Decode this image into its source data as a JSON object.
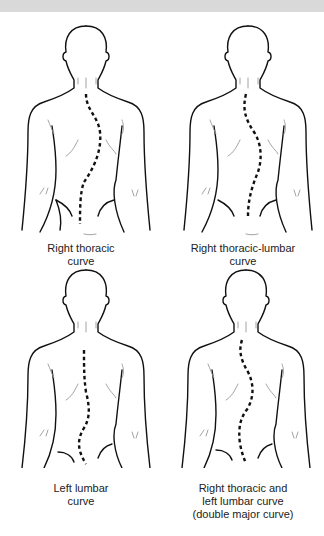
{
  "figure": {
    "panels": [
      {
        "id": "right-thoracic",
        "caption_lines": [
          "Right thoracic",
          "curve"
        ]
      },
      {
        "id": "right-thoracic-lumbar",
        "caption_lines": [
          "Right thoracic-lumbar",
          "curve"
        ]
      },
      {
        "id": "left-lumbar",
        "caption_lines": [
          "Left lumbar",
          "curve"
        ]
      },
      {
        "id": "double-major",
        "caption_lines": [
          "Right thoracic and",
          "left lumbar curve",
          "(double major curve)"
        ]
      }
    ]
  },
  "colors": {
    "header_bar": "#d9d9d9",
    "outline": "#111111",
    "detail": "#999999",
    "text": "#222222"
  }
}
